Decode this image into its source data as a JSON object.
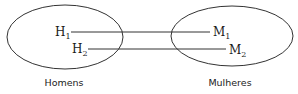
{
  "sets": [
    {
      "name": "Homens",
      "elements": [
        {
          "base": "H",
          "sub": "1"
        },
        {
          "base": "H",
          "sub": "2"
        }
      ]
    },
    {
      "name": "Mulheres",
      "elements": [
        {
          "base": "M",
          "sub": "1"
        },
        {
          "base": "M",
          "sub": "2"
        }
      ]
    }
  ],
  "mappings": [
    {
      "from": "H1",
      "to": "M1"
    },
    {
      "from": "H2",
      "to": "M2"
    }
  ],
  "colors": {
    "stroke": "#333333",
    "text": "#1a1a1a"
  }
}
